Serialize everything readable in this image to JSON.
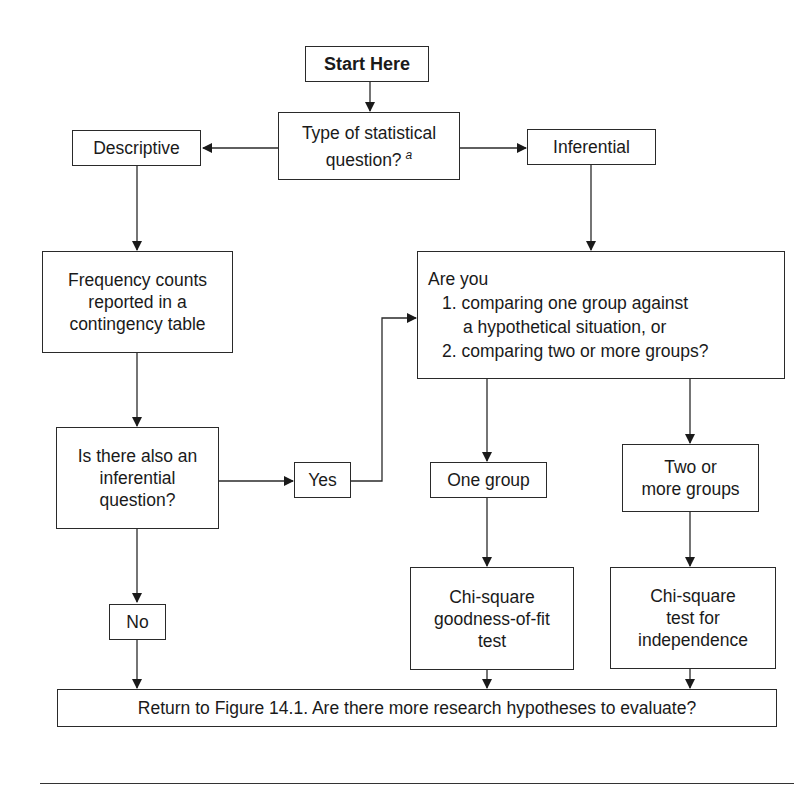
{
  "flowchart": {
    "start": {
      "label": "Start Here"
    },
    "question_type": {
      "line1": "Type of statistical",
      "line2": "question?",
      "footnote_marker": "a"
    },
    "descriptive": {
      "label": "Descriptive"
    },
    "inferential": {
      "label": "Inferential"
    },
    "frequency": {
      "lines": [
        "Frequency counts",
        "reported in a",
        "contingency table"
      ]
    },
    "also_inferential": {
      "lines": [
        "Is there also an",
        "inferential",
        "question?"
      ]
    },
    "yes": {
      "label": "Yes"
    },
    "no": {
      "label": "No"
    },
    "are_you": {
      "lines": [
        "Are you",
        "1. comparing one group against",
        "a hypothetical situation, or",
        "2. comparing two or more groups?"
      ]
    },
    "one_group": {
      "label": "One group"
    },
    "two_groups": {
      "lines": [
        "Two or",
        "more groups"
      ]
    },
    "goodness_of_fit": {
      "lines": [
        "Chi-square",
        "goodness-of-fit",
        "test"
      ]
    },
    "independence": {
      "lines": [
        "Chi-square",
        "test for",
        "independence"
      ]
    },
    "return": {
      "label": "Return to Figure 14.1. Are there more research hypotheses to evaluate?"
    }
  },
  "colors": {
    "stroke": "#2a2a2a",
    "background": "#ffffff",
    "text": "#1a1a1a"
  }
}
